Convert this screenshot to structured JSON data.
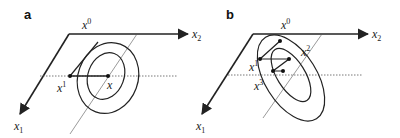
{
  "figure": {
    "panels": [
      {
        "id": "a",
        "label": "a",
        "axes": {
          "x1": "x",
          "x1_sub": "1",
          "x2": "x",
          "x2_sub": "2"
        },
        "points": {
          "x0": {
            "base": "x",
            "sup": "0"
          },
          "x1": {
            "base": "x",
            "sup": "1"
          },
          "x_star": {
            "base": "x",
            "sup": ""
          }
        },
        "ellipses": 2
      },
      {
        "id": "b",
        "label": "b",
        "axes": {
          "x1": "x",
          "x1_sub": "1",
          "x2": "x",
          "x2_sub": "2"
        },
        "points": {
          "x0": {
            "base": "x",
            "sup": "0"
          },
          "x1": {
            "base": "x",
            "sup": "1"
          },
          "x2": {
            "base": "x",
            "sup": "2"
          },
          "x3": {
            "base": "x",
            "sup": "3"
          }
        },
        "ellipses": 2
      }
    ],
    "colors": {
      "stroke": "#222222",
      "dotted": "#555555",
      "background": "#ffffff"
    }
  }
}
